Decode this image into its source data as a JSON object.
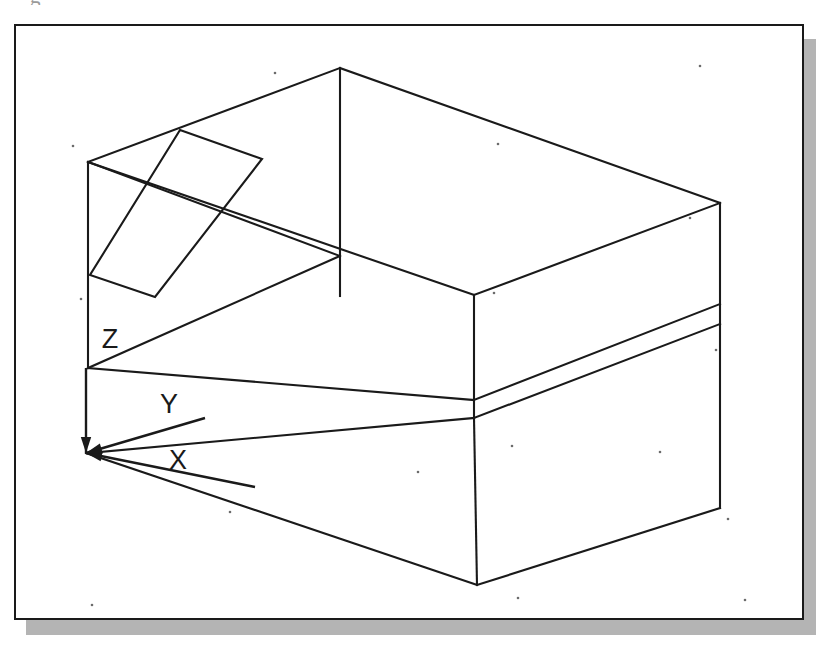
{
  "document": {
    "title": "Isometric wireframe of a rectangular box with an inclined slot",
    "top_glyph": "g",
    "background_color": "#ffffff",
    "line_color": "#1a1a1a",
    "shadow_color": "#b4b4b4",
    "frame_border_color": "#1a1a1a",
    "speck_color": "#6b6b6b"
  },
  "frame": {
    "x": 14,
    "y": 24,
    "width": 790,
    "height": 596,
    "border_width": 2,
    "shadow_offset_x": 12,
    "shadow_offset_y": 15
  },
  "ucs_icon": {
    "name": "ucs-coordinate-icon",
    "origin": {
      "x": 86,
      "y": 453
    },
    "axes": [
      {
        "label": "X",
        "label_x": 178,
        "label_y": 460,
        "tip_x": 255,
        "tip_y": 487
      },
      {
        "label": "Y",
        "label_x": 169,
        "label_y": 404,
        "tip_x": 205,
        "tip_y": 418
      },
      {
        "label": "Z",
        "label_x": 110,
        "label_y": 339,
        "tip_x": 86,
        "tip_y": 368
      }
    ],
    "label_font_size": 27
  },
  "chart_data": {
    "type": "wireframe-3d",
    "projection": "isometric",
    "stroke_width": 2.1,
    "vertices": {
      "top_back": {
        "x": 340,
        "y": 68
      },
      "top_left": {
        "x": 88,
        "y": 162
      },
      "top_right": {
        "x": 720,
        "y": 203
      },
      "top_front": {
        "x": 474,
        "y": 295
      },
      "mid_left": {
        "x": 88,
        "y": 368
      },
      "mid_front": {
        "x": 474,
        "y": 400
      },
      "mid_right": {
        "x": 720,
        "y": 304
      },
      "low_front": {
        "x": 474,
        "y": 418
      },
      "low_right": {
        "x": 720,
        "y": 324
      },
      "bottom_front": {
        "x": 477,
        "y": 585
      },
      "bottom_right": {
        "x": 720,
        "y": 508
      },
      "origin": {
        "x": 86,
        "y": 453
      }
    },
    "edges": [
      {
        "name": "top-face-back-left",
        "x1": 88,
        "y1": 162,
        "x2": 340,
        "y2": 68
      },
      {
        "name": "top-face-back-right",
        "x1": 340,
        "y1": 68,
        "x2": 720,
        "y2": 203
      },
      {
        "name": "top-face-front-left",
        "x1": 88,
        "y1": 162,
        "x2": 474,
        "y2": 295
      },
      {
        "name": "top-face-front-right",
        "x1": 474,
        "y1": 295,
        "x2": 720,
        "y2": 203
      },
      {
        "name": "back-vertical-edge",
        "x1": 340,
        "y1": 68,
        "x2": 340,
        "y2": 296
      },
      {
        "name": "back-left-lower-edge",
        "x1": 88,
        "y1": 162,
        "x2": 340,
        "y2": 256
      },
      {
        "name": "front-vertical-upper",
        "x1": 474,
        "y1": 295,
        "x2": 474,
        "y2": 418
      },
      {
        "name": "right-vertical-upper",
        "x1": 720,
        "y1": 203,
        "x2": 720,
        "y2": 324
      },
      {
        "name": "shelf-left-edge",
        "x1": 88,
        "y1": 368,
        "x2": 474,
        "y2": 400
      },
      {
        "name": "shelf-right-edge",
        "x1": 474,
        "y1": 400,
        "x2": 720,
        "y2": 304
      },
      {
        "name": "shelf-back-left",
        "x1": 88,
        "y1": 368,
        "x2": 340,
        "y2": 256
      },
      {
        "name": "left-vertical-edge",
        "x1": 88,
        "y1": 162,
        "x2": 88,
        "y2": 368
      },
      {
        "name": "lower-shelf-left",
        "x1": 88,
        "y1": 453,
        "x2": 474,
        "y2": 418
      },
      {
        "name": "lower-shelf-right",
        "x1": 474,
        "y1": 418,
        "x2": 720,
        "y2": 324
      },
      {
        "name": "bottom-left-edge",
        "x1": 86,
        "y1": 453,
        "x2": 477,
        "y2": 585
      },
      {
        "name": "bottom-right-edge",
        "x1": 477,
        "y1": 585,
        "x2": 720,
        "y2": 508
      },
      {
        "name": "front-vertical-lower",
        "x1": 477,
        "y1": 585,
        "x2": 474,
        "y2": 418
      },
      {
        "name": "right-vertical-lower",
        "x1": 720,
        "y1": 324,
        "x2": 720,
        "y2": 508
      }
    ],
    "inclined_slot": {
      "name": "inclined-slot-parallelogram",
      "points": [
        {
          "x": 180,
          "y": 130
        },
        {
          "x": 262,
          "y": 159
        },
        {
          "x": 155,
          "y": 297
        },
        {
          "x": 90,
          "y": 275
        }
      ]
    },
    "specks": [
      {
        "x": 275,
        "y": 73
      },
      {
        "x": 498,
        "y": 144
      },
      {
        "x": 700,
        "y": 66
      },
      {
        "x": 73,
        "y": 146
      },
      {
        "x": 690,
        "y": 218
      },
      {
        "x": 494,
        "y": 293
      },
      {
        "x": 81,
        "y": 299
      },
      {
        "x": 716,
        "y": 350
      },
      {
        "x": 512,
        "y": 446
      },
      {
        "x": 728,
        "y": 519
      },
      {
        "x": 92,
        "y": 605
      },
      {
        "x": 518,
        "y": 598
      },
      {
        "x": 745,
        "y": 600
      },
      {
        "x": 230,
        "y": 512
      },
      {
        "x": 418,
        "y": 472
      },
      {
        "x": 660,
        "y": 452
      }
    ]
  }
}
